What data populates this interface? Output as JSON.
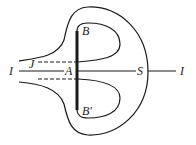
{
  "diagram": {
    "labels": {
      "I_left": "I",
      "J": "J",
      "A": "A",
      "B": "B",
      "B_prime": "B′",
      "S": "S",
      "I_right": "I"
    },
    "colors": {
      "stroke": "#1a1a1a",
      "background": "#ffffff"
    }
  }
}
